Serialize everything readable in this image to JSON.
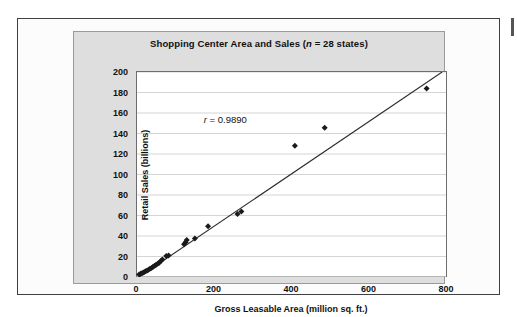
{
  "figure": {
    "frame_border_color": "#3f3f3f",
    "panel_fill_color": "#dedede",
    "plot_fill_color": "#ffffff",
    "gridline_color": "#c9c9c9",
    "marker_color": "#1a1a1a",
    "trendline_color": "#2a2a2a"
  },
  "chart_data": {
    "type": "scatter",
    "title": "Shopping Center Area and Sales (n = 28 states)",
    "title_prefix": "Shopping Center Area and Sales (",
    "title_italic": "n",
    "title_suffix": " = 28 states)",
    "xlabel": "Gross Leasable Area (million sq. ft.)",
    "ylabel": "Retail Sales (billions)",
    "xlim": [
      0,
      800
    ],
    "ylim": [
      0,
      200
    ],
    "xticks": [
      0,
      200,
      400,
      600,
      800
    ],
    "yticks": [
      0,
      20,
      40,
      60,
      80,
      100,
      120,
      140,
      160,
      180,
      200
    ],
    "grid": "horizontal",
    "legend": "none",
    "n": 28,
    "annotation": {
      "text": "r = 0.9890",
      "italic_symbol": "r",
      "rest": " = 0.9890",
      "value": 0.989,
      "x": 175,
      "y": 152
    },
    "trendline": {
      "type": "linear",
      "x_start": 0,
      "y_start": -2.0,
      "x_end": 790,
      "y_end": 200.0
    },
    "points": [
      {
        "x": 8,
        "y": 2.5
      },
      {
        "x": 12,
        "y": 3.2
      },
      {
        "x": 16,
        "y": 3.8
      },
      {
        "x": 20,
        "y": 4.5
      },
      {
        "x": 24,
        "y": 5.5
      },
      {
        "x": 28,
        "y": 6.2
      },
      {
        "x": 32,
        "y": 7.0
      },
      {
        "x": 36,
        "y": 8.0
      },
      {
        "x": 40,
        "y": 8.8
      },
      {
        "x": 44,
        "y": 10.0
      },
      {
        "x": 48,
        "y": 11.0
      },
      {
        "x": 52,
        "y": 12.0
      },
      {
        "x": 56,
        "y": 13.0
      },
      {
        "x": 60,
        "y": 14.0
      },
      {
        "x": 64,
        "y": 15.5
      },
      {
        "x": 68,
        "y": 17.0
      },
      {
        "x": 78,
        "y": 20.5
      },
      {
        "x": 84,
        "y": 21.0
      },
      {
        "x": 124,
        "y": 32.0
      },
      {
        "x": 128,
        "y": 34.0
      },
      {
        "x": 131,
        "y": 36.0
      },
      {
        "x": 152,
        "y": 37.5
      },
      {
        "x": 186,
        "y": 49.5
      },
      {
        "x": 262,
        "y": 61.5
      },
      {
        "x": 272,
        "y": 64.0
      },
      {
        "x": 410,
        "y": 128.0
      },
      {
        "x": 487,
        "y": 145.5
      },
      {
        "x": 750,
        "y": 184.0
      }
    ]
  }
}
